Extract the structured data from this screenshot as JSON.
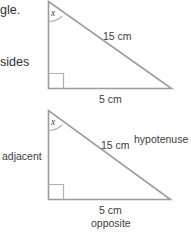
{
  "page": {
    "background_color": "#ffffff",
    "line_color": "#9a9a9a",
    "text_color": "#3d3d3d"
  },
  "text_fragments": {
    "top_left": "gle.",
    "mid_left": "sides"
  },
  "figures": [
    {
      "id": "triangle-1",
      "angle_label": "x",
      "hypotenuse_length": "15 cm",
      "base_length": "5 cm",
      "right_angle_marker": true
    },
    {
      "id": "triangle-2",
      "angle_label": "x",
      "hypotenuse_length": "15 cm",
      "base_length": "5 cm",
      "right_angle_marker": true,
      "side_names": {
        "hypotenuse": "hypotenuse",
        "adjacent": "adjacent",
        "opposite": "opposite"
      }
    }
  ]
}
